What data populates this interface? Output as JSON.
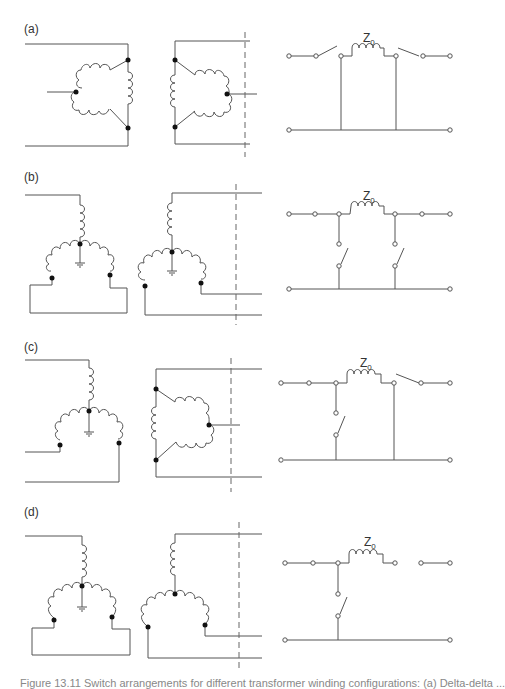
{
  "figure": {
    "panels": [
      {
        "id": "a",
        "label": "(a)",
        "primary": "delta",
        "secondary": "delta",
        "impedance_label": "Z",
        "impedance_sub": "0",
        "circuit": "series switches open on both sides of Z0, both shunt legs closed to return line"
      },
      {
        "id": "b",
        "label": "(b)",
        "primary": "wye-grounded",
        "secondary": "wye-grounded",
        "impedance_label": "Z",
        "impedance_sub": "0",
        "circuit": "series path closed, shunt switches open on both sides"
      },
      {
        "id": "c",
        "label": "(c)",
        "primary": "wye-grounded",
        "secondary": "delta",
        "impedance_label": "Z",
        "impedance_sub": "0",
        "circuit": "left shunt switch open, right side series switch open, right shunt leg connected"
      },
      {
        "id": "d",
        "label": "(d)",
        "primary": "wye-grounded",
        "secondary": "wye",
        "impedance_label": "Z",
        "impedance_sub": "0",
        "circuit": "left shunt switch open, series path open at right"
      }
    ],
    "caption": "Figure 13.11 Switch arrangements for different transformer winding configurations: (a) Delta-delta ..."
  }
}
